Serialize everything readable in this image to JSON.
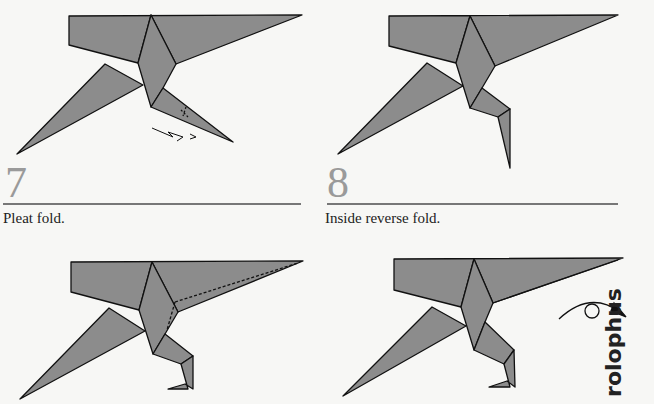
{
  "steps": [
    {
      "number": "7",
      "caption": "Pleat fold.",
      "fold_type": "pleat-fold"
    },
    {
      "number": "8",
      "caption": "Inside reverse fold.",
      "fold_type": "inside-reverse-fold"
    },
    {
      "number": "9",
      "caption": "",
      "fold_type": "valley-fold-dashed"
    },
    {
      "number": "10",
      "caption": "",
      "fold_type": "turn-over"
    }
  ],
  "side_text": "rolophus",
  "colors": {
    "paper": "#8c8c8c",
    "outline": "#111111",
    "step_number": "#9a9a9a",
    "rule": "#777777",
    "background": "#f7f7f5"
  }
}
